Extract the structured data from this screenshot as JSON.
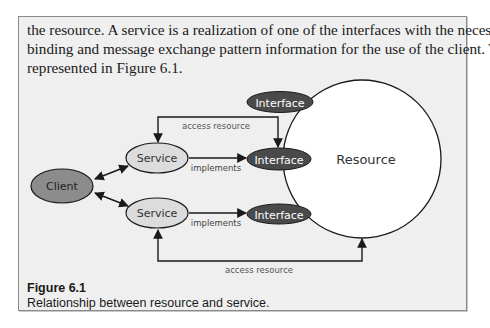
{
  "paragraph": {
    "lines": [
      "the resource. A service is a realization of one of the interfaces with the necessary",
      "binding and message exchange pattern information for the use of the client. This is",
      "represented in Figure 6.1."
    ]
  },
  "diagram": {
    "nodes": {
      "client": "Client",
      "service_top": "Service",
      "service_bottom": "Service",
      "interface_top": "Interface",
      "interface_middle": "Interface",
      "interface_bottom": "Interface",
      "resource": "Resource"
    },
    "edges": {
      "implements_top": "implements",
      "implements_bottom": "implements",
      "access_top": "access resource",
      "access_bottom": "access resource"
    },
    "colors": {
      "client_fill": "#8c8c8c",
      "service_fill": "#dcdcdc",
      "interface_fill": "#4a4a4a",
      "resource_fill": "#ffffff",
      "stroke": "#1a1a1a",
      "label_gray": "#555555"
    }
  },
  "caption": {
    "title": "Figure 6.1",
    "text": "Relationship between resource and service."
  }
}
